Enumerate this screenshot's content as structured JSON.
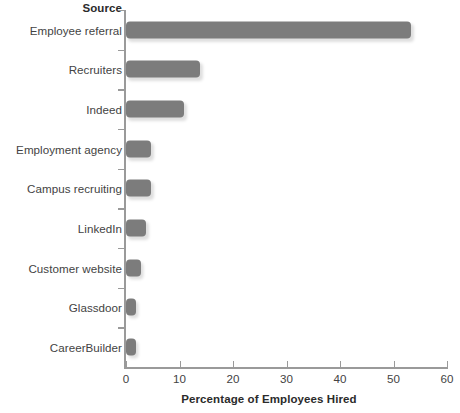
{
  "chart_data": {
    "type": "bar",
    "orientation": "horizontal",
    "title": "",
    "xlabel": "Percentage of Employees Hired",
    "ylabel": "Source",
    "categories": [
      "Employee referral",
      "Recruiters",
      "Indeed",
      "Employment agency",
      "Campus recruiting",
      "LinkedIn",
      "Customer website",
      "Glassdoor",
      "CareerBuilder"
    ],
    "values": [
      53.3,
      13.8,
      10.8,
      4.7,
      4.7,
      3.7,
      2.8,
      1.9,
      1.9
    ],
    "xlim": [
      0,
      60
    ],
    "xticks": [
      0,
      10,
      20,
      30,
      40,
      50,
      60
    ],
    "xtick_labels": [
      "0",
      "10",
      "20",
      "30",
      "40",
      "50",
      "60"
    ],
    "grid": false,
    "legend": false,
    "bar_color": "#7c7c7c",
    "axis_color": "#9a9a9a",
    "background": "#ffffff"
  }
}
